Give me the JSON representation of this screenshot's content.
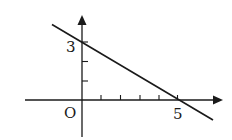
{
  "diagram": {
    "type": "coordinate-plane-line",
    "origin_label": "O",
    "y_intercept_label": "3",
    "x_intercept_label": "5",
    "line": {
      "y_intercept": 3,
      "x_intercept": 5
    },
    "x_ticks_count": 5,
    "y_ticks_count": 3,
    "colors": {
      "ink": "#1a1a1a",
      "background": "#ffffff"
    }
  }
}
